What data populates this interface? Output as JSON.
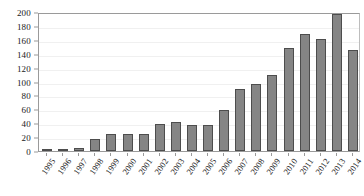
{
  "chart_data": {
    "type": "bar",
    "title": "",
    "subtitle": "",
    "xlabel": "",
    "ylabel": "",
    "categories": [
      "1995",
      "1996",
      "1997",
      "1998",
      "1999",
      "2000",
      "2001",
      "2002",
      "2003",
      "2004",
      "2005",
      "2006",
      "2007",
      "2008",
      "2009",
      "2010",
      "2011",
      "2012",
      "2013",
      "2014"
    ],
    "values": [
      2,
      2,
      4,
      17,
      24,
      25,
      25,
      39,
      42,
      38,
      37,
      59,
      89,
      97,
      110,
      148,
      168,
      161,
      197,
      145
    ],
    "series": [
      {
        "name": "Count",
        "values": [
          2,
          2,
          4,
          17,
          24,
          25,
          25,
          39,
          42,
          38,
          37,
          59,
          89,
          97,
          110,
          148,
          168,
          161,
          197,
          145
        ]
      }
    ],
    "ylim": [
      0,
      200
    ],
    "ytick_values": [
      0,
      20,
      40,
      60,
      80,
      100,
      120,
      140,
      160,
      180,
      200
    ],
    "ytick_labels": [
      "0",
      "20",
      "40",
      "60",
      "80",
      "100",
      "120",
      "140",
      "160",
      "180",
      "200"
    ],
    "grid": true,
    "grid_axis": "y",
    "legend": false,
    "legend_position": "none",
    "bar_fill_color": "#858585",
    "bar_edge_color": "#4d4d4d",
    "axis_color": "#9a9a9a",
    "grid_color": "#f0f0f0",
    "text_color": "#1a1a1a",
    "background_color": "#ffffff",
    "xtick_rotation": -55,
    "annotations": []
  }
}
